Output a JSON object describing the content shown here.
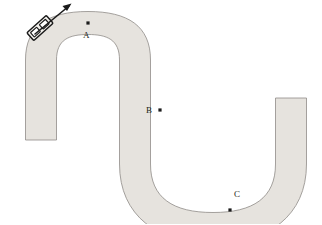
{
  "figure": {
    "kind": "physics-diagram",
    "width": 322,
    "height": 224,
    "background_color": "#ffffff"
  },
  "track": {
    "name": "roller-coaster-track",
    "fill_color": "#e6e3de",
    "edge_color": "#8f8c88",
    "edge_width": 0.8,
    "band_width": 11,
    "description": "Continuous S-curve: vertical left rail rising to a large convex hill at upper left, descending to a central vertical section, then into a concave valley at lower right, rising to a vertical right rail."
  },
  "cart": {
    "name": "roller-coaster-cart",
    "body_fill": "#f2f0ec",
    "body_stroke": "#1b1b1b",
    "position_x": 40,
    "position_y": 28,
    "description": "Small rectangular cart with two windows riding on the outer edge of the upper-left hill"
  },
  "velocity_arrow": {
    "name": "velocity-arrow",
    "color": "#1b1b1b",
    "from_x": 39,
    "from_y": 31,
    "to_x": 70,
    "to_y": 5,
    "description": "Arrow pointing up and to the right, tangent to the track, indicating direction of motion"
  },
  "points": [
    {
      "id": "A",
      "label": "A",
      "dot_x": 88,
      "dot_y": 23,
      "label_x": 83,
      "label_y": 31,
      "dot_color": "#1b1b1b",
      "dot_size": 3.2,
      "placement": "below-dot"
    },
    {
      "id": "B",
      "label": "B",
      "dot_x": 160,
      "dot_y": 110,
      "label_x": 146,
      "label_y": 106,
      "dot_color": "#1b1b1b",
      "dot_size": 3.2,
      "placement": "left-of-dot"
    },
    {
      "id": "C",
      "label": "C",
      "dot_x": 230,
      "dot_y": 210,
      "label_x": 234,
      "label_y": 190,
      "dot_color": "#1b1b1b",
      "dot_size": 3.2,
      "placement": "above-dot"
    }
  ]
}
